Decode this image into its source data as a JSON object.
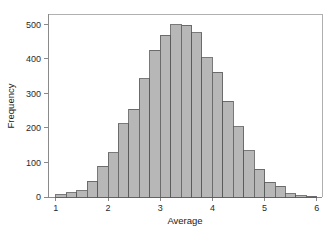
{
  "chart_data": {
    "type": "bar",
    "title": "",
    "subtitle": "",
    "xlabel": "Average",
    "ylabel": "Frequency",
    "xlim": [
      0.85,
      6.1
    ],
    "ylim": [
      0,
      530
    ],
    "grid": false,
    "legend": null,
    "bin_width": 0.2,
    "xticks": [
      1,
      2,
      3,
      4,
      5,
      6
    ],
    "xtick_labels": [
      "1",
      "2",
      "3",
      "4",
      "5",
      "6"
    ],
    "yticks": [
      0,
      100,
      200,
      300,
      400,
      500
    ],
    "ytick_labels": [
      "0",
      "100",
      "200",
      "300",
      "400",
      "500"
    ],
    "bin_starts": [
      1.0,
      1.2,
      1.4,
      1.6,
      1.8,
      2.0,
      2.2,
      2.4,
      2.6,
      2.8,
      3.0,
      3.2,
      3.4,
      3.6,
      3.8,
      4.0,
      4.2,
      4.4,
      4.6,
      4.8,
      5.0,
      5.2,
      5.4,
      5.6,
      5.8
    ],
    "bin_centers": [
      1.1,
      1.3,
      1.5,
      1.7,
      1.9,
      2.1,
      2.3,
      2.5,
      2.7,
      2.9,
      3.1,
      3.3,
      3.5,
      3.7,
      3.9,
      4.1,
      4.3,
      4.5,
      4.7,
      4.9,
      5.1,
      5.3,
      5.5,
      5.7,
      5.9
    ],
    "categories": [
      "1.0-1.2",
      "1.2-1.4",
      "1.4-1.6",
      "1.6-1.8",
      "1.8-2.0",
      "2.0-2.2",
      "2.2-2.4",
      "2.4-2.6",
      "2.6-2.8",
      "2.8-3.0",
      "3.0-3.2",
      "3.2-3.4",
      "3.4-3.6",
      "3.6-3.8",
      "3.8-4.0",
      "4.0-4.2",
      "4.2-4.4",
      "4.4-4.6",
      "4.6-4.8",
      "4.8-5.0",
      "5.0-5.2",
      "5.2-5.4",
      "5.4-5.6",
      "5.6-5.8",
      "5.8-6.0"
    ],
    "values": [
      6,
      13,
      18,
      45,
      89,
      128,
      212,
      254,
      343,
      425,
      469,
      499,
      497,
      475,
      403,
      361,
      278,
      203,
      134,
      81,
      43,
      31,
      9,
      4,
      2
    ]
  },
  "style": {
    "bar_fill": "#b7b7b7",
    "bar_stroke": "#585858",
    "axis_color": "#8a8a8a",
    "frame_color": "#b0b0b0",
    "text_color": "#2a2a2a",
    "background": "#ffffff"
  }
}
